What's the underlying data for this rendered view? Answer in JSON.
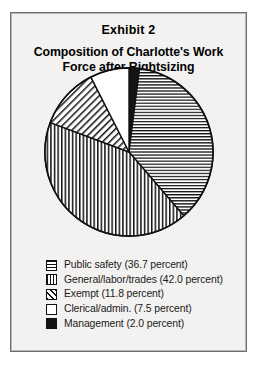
{
  "figure": {
    "exhibit_label": "Exhibit 2",
    "title": "Composition of Charlotte's Work Force after Rightsizing",
    "background_color": "#f3f2f0",
    "border_color": "#6d6d6d"
  },
  "chart_data": {
    "type": "pie",
    "title": "Composition of Charlotte's Work Force after Rightsizing",
    "subtitle": "Exhibit 2",
    "xlabel": "",
    "ylabel": "",
    "units": "percent",
    "start_angle_deg": 0,
    "direction": "clockwise",
    "legend_position": "bottom-left",
    "grid": false,
    "categories": [
      "Public safety",
      "General/labor/trades",
      "Exempt",
      "Clerical/admin.",
      "Management"
    ],
    "values": [
      36.7,
      42.0,
      11.8,
      7.5,
      2.0
    ],
    "total": 100.0,
    "slices": [
      {
        "label": "Public safety",
        "value": 36.7,
        "legend_text": "Public safety (36.7 percent)",
        "pattern": "horizontal-lines",
        "fill": "#ffffff",
        "stroke": "#111111",
        "start_deg": 7.2,
        "end_deg": 139.32
      },
      {
        "label": "General/labor/trades",
        "value": 42.0,
        "legend_text": "General/labor/trades (42.0 percent)",
        "pattern": "vertical-lines",
        "fill": "#ffffff",
        "stroke": "#111111",
        "start_deg": 139.32,
        "end_deg": 290.52
      },
      {
        "label": "Exempt",
        "value": 11.8,
        "legend_text": "Exempt (11.8 percent)",
        "pattern": "diagonal-hatch",
        "fill": "#ffffff",
        "stroke": "#111111",
        "start_deg": 290.52,
        "end_deg": 333.0
      },
      {
        "label": "Clerical/admin.",
        "value": 7.5,
        "legend_text": "Clerical/admin. (7.5 percent)",
        "pattern": "empty",
        "fill": "#ffffff",
        "stroke": "#111111",
        "start_deg": 333.0,
        "end_deg": 360.0
      },
      {
        "label": "Management",
        "value": 2.0,
        "legend_text": "Management (2.0 percent)",
        "pattern": "solid-black",
        "fill": "#141414",
        "stroke": "#111111",
        "start_deg": 0.0,
        "end_deg": 7.2
      }
    ]
  }
}
